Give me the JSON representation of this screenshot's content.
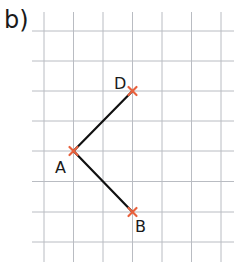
{
  "part_label": "b)",
  "grid": {
    "x_lines": [
      44,
      73.5,
      103,
      132.5,
      162,
      191.5,
      221
    ],
    "y_lines": [
      31,
      61,
      91,
      121,
      151,
      181.5,
      212,
      242
    ],
    "color": "#b9bcc2"
  },
  "points": [
    {
      "name": "D",
      "x": 132.5,
      "y": 91
    },
    {
      "name": "A",
      "x": 73.5,
      "y": 151
    },
    {
      "name": "B",
      "x": 132.5,
      "y": 212
    }
  ],
  "segments": [
    [
      "A",
      "D"
    ],
    [
      "A",
      "B"
    ]
  ],
  "colors": {
    "marker": "#e8603c",
    "segment": "#111111"
  }
}
